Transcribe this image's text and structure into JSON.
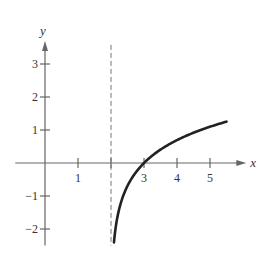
{
  "chart_data": {
    "type": "line",
    "title": "",
    "xlabel": "x",
    "ylabel": "y",
    "xlim": [
      -0.9,
      6.1
    ],
    "ylim": [
      -2.5,
      3.7
    ],
    "x_ticks": [
      1,
      3,
      4,
      5
    ],
    "x_tick_labels": [
      "1",
      "3",
      "4",
      "5"
    ],
    "x_tick_marks": [
      1,
      2,
      3,
      4,
      5
    ],
    "y_ticks": [
      -2,
      -1,
      1,
      2,
      3
    ],
    "y_tick_labels": [
      "−2",
      "−1",
      "1",
      "2",
      "3"
    ],
    "grid": false,
    "asymptote": {
      "type": "vertical",
      "x": 2,
      "style": "dashed"
    },
    "series": [
      {
        "name": "y = ln(x - 2)",
        "function": "ln(x-2)",
        "x_range": [
          2.09,
          5.5
        ],
        "points": [
          [
            2.09,
            -2.41
          ],
          [
            2.15,
            -1.9
          ],
          [
            2.25,
            -1.39
          ],
          [
            2.5,
            -0.69
          ],
          [
            3,
            0
          ],
          [
            3.5,
            0.41
          ],
          [
            4,
            0.69
          ],
          [
            4.5,
            0.92
          ],
          [
            5,
            1.1
          ],
          [
            5.5,
            1.25
          ]
        ]
      }
    ]
  }
}
